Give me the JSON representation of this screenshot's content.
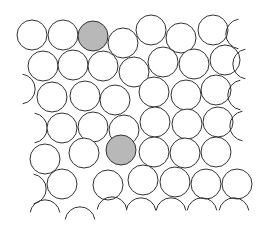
{
  "diagram": {
    "title": "",
    "type": "circle-packing",
    "width": 262,
    "height": 241,
    "stroke_color": "#333333",
    "fill_color": "#ffffff",
    "highlight_color": "#b8b8b8",
    "radius": 15,
    "circles": [
      {
        "x": 32,
        "y": 35,
        "highlight": false,
        "arc": null
      },
      {
        "x": 63,
        "y": 35,
        "highlight": false,
        "arc": null
      },
      {
        "x": 93,
        "y": 36,
        "highlight": true,
        "arc": null
      },
      {
        "x": 123,
        "y": 43,
        "highlight": false,
        "arc": null
      },
      {
        "x": 151,
        "y": 30,
        "highlight": false,
        "arc": null
      },
      {
        "x": 181,
        "y": 38,
        "highlight": false,
        "arc": null
      },
      {
        "x": 213,
        "y": 30,
        "highlight": false,
        "arc": null
      },
      {
        "x": 241,
        "y": 34,
        "highlight": false,
        "arc": "left"
      },
      {
        "x": 43,
        "y": 66,
        "highlight": false,
        "arc": null
      },
      {
        "x": 73,
        "y": 65,
        "highlight": false,
        "arc": null
      },
      {
        "x": 103,
        "y": 66,
        "highlight": false,
        "arc": null
      },
      {
        "x": 134,
        "y": 72,
        "highlight": false,
        "arc": null
      },
      {
        "x": 163,
        "y": 62,
        "highlight": false,
        "arc": null
      },
      {
        "x": 194,
        "y": 64,
        "highlight": false,
        "arc": null
      },
      {
        "x": 225,
        "y": 60,
        "highlight": false,
        "arc": null
      },
      {
        "x": 248,
        "y": 64,
        "highlight": false,
        "arc": "left"
      },
      {
        "x": 20,
        "y": 89,
        "highlight": false,
        "arc": "right"
      },
      {
        "x": 52,
        "y": 97,
        "highlight": false,
        "arc": null
      },
      {
        "x": 85,
        "y": 96,
        "highlight": false,
        "arc": null
      },
      {
        "x": 115,
        "y": 100,
        "highlight": false,
        "arc": null
      },
      {
        "x": 154,
        "y": 92,
        "highlight": false,
        "arc": null
      },
      {
        "x": 186,
        "y": 95,
        "highlight": false,
        "arc": null
      },
      {
        "x": 216,
        "y": 90,
        "highlight": false,
        "arc": null
      },
      {
        "x": 243,
        "y": 95,
        "highlight": false,
        "arc": "left"
      },
      {
        "x": 32,
        "y": 128,
        "highlight": false,
        "arc": "right"
      },
      {
        "x": 62,
        "y": 128,
        "highlight": false,
        "arc": null
      },
      {
        "x": 93,
        "y": 127,
        "highlight": false,
        "arc": null
      },
      {
        "x": 124,
        "y": 130,
        "highlight": false,
        "arc": null
      },
      {
        "x": 155,
        "y": 122,
        "highlight": false,
        "arc": null
      },
      {
        "x": 187,
        "y": 124,
        "highlight": false,
        "arc": null
      },
      {
        "x": 218,
        "y": 122,
        "highlight": false,
        "arc": null
      },
      {
        "x": 245,
        "y": 126,
        "highlight": false,
        "arc": "left"
      },
      {
        "x": 45,
        "y": 159,
        "highlight": false,
        "arc": null
      },
      {
        "x": 84,
        "y": 153,
        "highlight": false,
        "arc": null
      },
      {
        "x": 121,
        "y": 150,
        "highlight": true,
        "arc": null
      },
      {
        "x": 154,
        "y": 152,
        "highlight": false,
        "arc": null
      },
      {
        "x": 185,
        "y": 153,
        "highlight": false,
        "arc": null
      },
      {
        "x": 216,
        "y": 152,
        "highlight": false,
        "arc": null
      },
      {
        "x": 31,
        "y": 189,
        "highlight": false,
        "arc": "right"
      },
      {
        "x": 62,
        "y": 184,
        "highlight": false,
        "arc": null
      },
      {
        "x": 108,
        "y": 185,
        "highlight": false,
        "arc": null
      },
      {
        "x": 143,
        "y": 180,
        "highlight": false,
        "arc": null
      },
      {
        "x": 175,
        "y": 182,
        "highlight": false,
        "arc": null
      },
      {
        "x": 206,
        "y": 184,
        "highlight": false,
        "arc": null
      },
      {
        "x": 237,
        "y": 184,
        "highlight": false,
        "arc": null
      },
      {
        "x": 45,
        "y": 215,
        "highlight": false,
        "arc": "top"
      },
      {
        "x": 80,
        "y": 222,
        "highlight": false,
        "arc": "top"
      },
      {
        "x": 112,
        "y": 212,
        "highlight": false,
        "arc": "top"
      },
      {
        "x": 141,
        "y": 213,
        "highlight": false,
        "arc": "top"
      },
      {
        "x": 171,
        "y": 213,
        "highlight": false,
        "arc": "top"
      },
      {
        "x": 202,
        "y": 213,
        "highlight": false,
        "arc": "top"
      },
      {
        "x": 234,
        "y": 213,
        "highlight": false,
        "arc": "top"
      }
    ]
  }
}
